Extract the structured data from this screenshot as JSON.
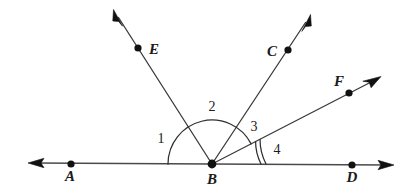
{
  "figure": {
    "kind": "geometry-diagram",
    "background_color": "#ffffff",
    "stroke_color": "#2e2e2e",
    "label_color": "#1a1a1a",
    "width": 414,
    "height": 190
  },
  "points": [
    {
      "id": "A",
      "label": "A",
      "x": 71,
      "y": 164,
      "label_x": 70,
      "label_y": 181,
      "on": "line-AD"
    },
    {
      "id": "B",
      "label": "B",
      "x": 212,
      "y": 164,
      "label_x": 212,
      "label_y": 184,
      "on": "vertex"
    },
    {
      "id": "D",
      "label": "D",
      "x": 352,
      "y": 165,
      "label_x": 352,
      "label_y": 182,
      "on": "line-AD"
    },
    {
      "id": "E",
      "label": "E",
      "x": 138,
      "y": 48,
      "label_x": 154,
      "label_y": 54,
      "on": "ray-BE"
    },
    {
      "id": "C",
      "label": "C",
      "x": 288,
      "y": 50,
      "label_x": 272,
      "label_y": 56,
      "on": "ray-BC"
    },
    {
      "id": "F",
      "label": "F",
      "x": 349,
      "y": 93,
      "label_x": 339,
      "label_y": 86,
      "on": "ray-BF"
    }
  ],
  "vertex": {
    "id": "B",
    "x": 212,
    "y": 164
  },
  "lines": [
    {
      "id": "line-AD",
      "name": "line-ad",
      "from": {
        "x": 30,
        "y": 163
      },
      "to": {
        "x": 392,
        "y": 165
      },
      "arrow_start": true,
      "arrow_end": true,
      "through": [
        "A",
        "B",
        "D"
      ]
    }
  ],
  "rays": [
    {
      "id": "ray-BE",
      "name": "ray-be",
      "from": {
        "x": 212,
        "y": 164
      },
      "to": {
        "x": 115,
        "y": 12
      },
      "through_point": "E",
      "arrow_end": true,
      "angle_deg": 122.5
    },
    {
      "id": "ray-BC",
      "name": "ray-bc",
      "from": {
        "x": 212,
        "y": 164
      },
      "to": {
        "x": 309,
        "y": 17
      },
      "through_point": "C",
      "arrow_end": true,
      "angle_deg": 56.6
    },
    {
      "id": "ray-BF",
      "name": "ray-bf",
      "from": {
        "x": 212,
        "y": 164
      },
      "to": {
        "x": 379,
        "y": 78
      },
      "through_point": "F",
      "arrow_end": true,
      "angle_deg": 27.2
    }
  ],
  "angle_arcs": [
    {
      "id": "arc-main",
      "name": "angle-arc-main",
      "radius": 44,
      "start_deg": 180,
      "end_deg": 27.2,
      "ticks": 1,
      "note": "single large arc from ray BA around to ray BF"
    },
    {
      "id": "arc-angle4",
      "name": "angle-arc-4-inner",
      "radius": 49,
      "start_deg": 27.2,
      "end_deg": 0,
      "ticks": 2,
      "note": "double arc marking angle 4 between ray BF and ray BD"
    },
    {
      "id": "arc-angle4-outer",
      "name": "angle-arc-4-outer",
      "radius": 54,
      "start_deg": 27.2,
      "end_deg": 0,
      "ticks": 2,
      "note": "second stroke of the double arc for angle 4"
    }
  ],
  "angle_labels": [
    {
      "id": "1",
      "label": "1",
      "x": 161,
      "y": 143,
      "between": [
        "ray-BA",
        "ray-BE"
      ]
    },
    {
      "id": "2",
      "label": "2",
      "x": 212,
      "y": 111,
      "between": [
        "ray-BE",
        "ray-BC"
      ]
    },
    {
      "id": "3",
      "label": "3",
      "x": 254,
      "y": 131,
      "between": [
        "ray-BC",
        "ray-BF"
      ]
    },
    {
      "id": "4",
      "label": "4",
      "x": 277,
      "y": 154,
      "between": [
        "ray-BF",
        "ray-BD"
      ]
    }
  ]
}
